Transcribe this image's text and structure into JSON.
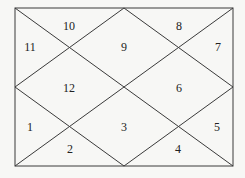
{
  "chart": {
    "type": "north-indian-birth-chart",
    "frame": {
      "left": 15,
      "top": 8,
      "right": 233,
      "bottom": 166
    },
    "houses": [
      {
        "label": "10",
        "x": 69,
        "y": 27
      },
      {
        "label": "11",
        "x": 30,
        "y": 48
      },
      {
        "label": "9",
        "x": 124,
        "y": 48
      },
      {
        "label": "8",
        "x": 179,
        "y": 27
      },
      {
        "label": "7",
        "x": 218,
        "y": 48
      },
      {
        "label": "12",
        "x": 69,
        "y": 89
      },
      {
        "label": "6",
        "x": 179,
        "y": 89
      },
      {
        "label": "1",
        "x": 30,
        "y": 128
      },
      {
        "label": "3",
        "x": 124,
        "y": 128
      },
      {
        "label": "5",
        "x": 217,
        "y": 128
      },
      {
        "label": "2",
        "x": 70,
        "y": 150
      },
      {
        "label": "4",
        "x": 178,
        "y": 150
      }
    ]
  }
}
